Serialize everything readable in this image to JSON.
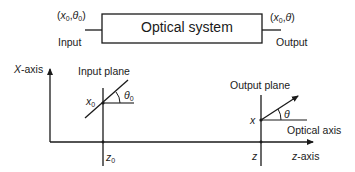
{
  "top": {
    "box_label": "Optical system",
    "input_label": "Input",
    "output_label": "Output",
    "input_coord": {
      "open": "(",
      "x": "x",
      "x_sub": "0",
      "sep": ",",
      "theta": "θ",
      "theta_sub": "0",
      "close": ")"
    },
    "output_coord": {
      "open": "(",
      "x": "x",
      "x_sub": "0",
      "sep": ",",
      "theta": "θ",
      "close": ")"
    }
  },
  "bottom": {
    "x_axis_label_var": "X",
    "x_axis_label_rest": "-axis",
    "z_axis_label_var": "z",
    "z_axis_label_rest": "-axis",
    "input_plane_label": "Input plane",
    "output_plane_label": "Output plane",
    "optical_axis_label": "Optical axis",
    "input_point": {
      "var": "x",
      "sub": "0"
    },
    "input_angle": {
      "var": "θ",
      "sub": "0"
    },
    "input_z": {
      "var": "z",
      "sub": "0"
    },
    "output_point": {
      "var": "x"
    },
    "output_angle": {
      "var": "θ"
    },
    "output_z": {
      "var": "z"
    }
  },
  "colors": {
    "stroke": "#1a1a1a",
    "background": "#ffffff"
  }
}
